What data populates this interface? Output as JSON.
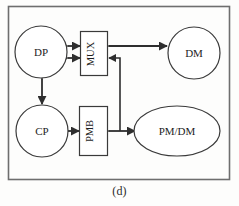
{
  "figure": {
    "caption": "(d)",
    "frame": {
      "x": 8,
      "y": 6,
      "width": 222,
      "height": 174
    },
    "stroke_color": "#3a3a3a",
    "fill_color": "#ffffff",
    "background_color": "#fdfdfc"
  },
  "nodes": [
    {
      "id": "dp",
      "label": "DP",
      "shape": "circle",
      "cx": 41,
      "cy": 52,
      "rx": 26,
      "ry": 26,
      "orientation": "horizontal"
    },
    {
      "id": "mux",
      "label": "MUX",
      "shape": "rect",
      "x": 80,
      "y": 31,
      "width": 28,
      "height": 45,
      "orientation": "vertical"
    },
    {
      "id": "dm",
      "label": "DM",
      "shape": "circle",
      "cx": 194,
      "cy": 53,
      "rx": 26,
      "ry": 26,
      "orientation": "horizontal"
    },
    {
      "id": "cp",
      "label": "CP",
      "shape": "circle",
      "cx": 42,
      "cy": 131,
      "rx": 26,
      "ry": 26,
      "orientation": "horizontal"
    },
    {
      "id": "pmb",
      "label": "PMB",
      "shape": "rect",
      "x": 79,
      "y": 106,
      "width": 29,
      "height": 50,
      "orientation": "vertical"
    },
    {
      "id": "pmdm",
      "label": "PM/DM",
      "shape": "ellipse",
      "cx": 177,
      "cy": 131,
      "rx": 43,
      "ry": 25,
      "orientation": "horizontal"
    }
  ],
  "connections": [
    {
      "id": "dp-mux-upper",
      "from": "dp",
      "to": "mux",
      "arrow": "double",
      "orientation": "horizontal"
    },
    {
      "id": "dp-mux-lower",
      "from": "dp",
      "to": "mux",
      "arrow": "double",
      "orientation": "horizontal"
    },
    {
      "id": "mux-dm",
      "from": "mux",
      "to": "dm",
      "arrow": "double",
      "orientation": "horizontal"
    },
    {
      "id": "dp-cp",
      "from": "dp",
      "to": "cp",
      "arrow": "double",
      "orientation": "vertical"
    },
    {
      "id": "cp-pmb",
      "from": "cp",
      "to": "pmb",
      "arrow": "double",
      "orientation": "horizontal"
    },
    {
      "id": "pmb-pmdm",
      "from": "pmb",
      "to": "pmdm",
      "arrow": "double",
      "orientation": "horizontal"
    },
    {
      "id": "mux-pmbus",
      "from": "mux",
      "to": "pmb-pmdm",
      "arrow": "single",
      "orientation": "elbow"
    }
  ]
}
